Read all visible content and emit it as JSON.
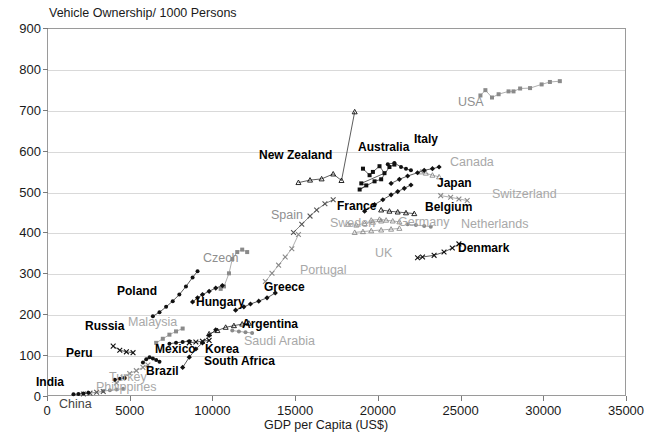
{
  "chart_data": {
    "type": "scatter",
    "title": "Vehicle Ownership/ 1000 Persons",
    "xlabel": "GDP per Capita (US$)",
    "ylabel": "Vehicle Ownership/ 1000 Persons",
    "xlim": [
      0,
      35000
    ],
    "ylim": [
      0,
      900
    ],
    "xticks": [
      0,
      5000,
      10000,
      15000,
      20000,
      25000,
      30000,
      35000
    ],
    "yticks": [
      0,
      100,
      200,
      300,
      400,
      500,
      600,
      700,
      800,
      900
    ],
    "grid": "horizontal",
    "legend": "inline-labels",
    "series": [
      {
        "name": "USA",
        "label_style": "gray",
        "marker": "square",
        "points": [
          [
            26200,
            735
          ],
          [
            26500,
            748
          ],
          [
            26900,
            730
          ],
          [
            27300,
            738
          ],
          [
            27900,
            745
          ],
          [
            28200,
            745
          ],
          [
            28600,
            752
          ],
          [
            29200,
            753
          ],
          [
            29900,
            762
          ],
          [
            30400,
            768
          ],
          [
            31000,
            770
          ]
        ]
      },
      {
        "name": "New Zealand",
        "label_style": "dark",
        "marker": "triangle",
        "points": [
          [
            15200,
            522
          ],
          [
            15900,
            528
          ],
          [
            16600,
            531
          ],
          [
            17300,
            543
          ],
          [
            17800,
            527
          ],
          [
            18600,
            695
          ]
        ]
      },
      {
        "name": "Australia",
        "label_style": "dark",
        "marker": "square",
        "points": [
          [
            19100,
            556
          ],
          [
            19500,
            540
          ],
          [
            19700,
            548
          ],
          [
            20100,
            562
          ],
          [
            20400,
            545
          ],
          [
            19000,
            520
          ],
          [
            19300,
            515
          ],
          [
            18900,
            505
          ],
          [
            19800,
            525
          ],
          [
            20200,
            530
          ],
          [
            20700,
            560
          ],
          [
            21000,
            566
          ]
        ]
      },
      {
        "name": "Italy",
        "label_style": "dark",
        "marker": "circle",
        "points": [
          [
            20600,
            567
          ],
          [
            21000,
            570
          ],
          [
            21400,
            560
          ],
          [
            21700,
            556
          ],
          [
            22000,
            552
          ]
        ]
      },
      {
        "name": "Canada",
        "label_style": "gray",
        "marker": "triangle",
        "points": [
          [
            22600,
            548
          ],
          [
            22900,
            545
          ],
          [
            23300,
            540
          ],
          [
            23700,
            536
          ]
        ]
      },
      {
        "name": "Japan",
        "label_style": "dark",
        "marker": "diamond",
        "points": [
          [
            20800,
            520
          ],
          [
            21300,
            530
          ],
          [
            21800,
            538
          ],
          [
            22400,
            546
          ],
          [
            22800,
            552
          ],
          [
            23300,
            556
          ],
          [
            23700,
            560
          ]
        ]
      },
      {
        "name": "Switzerland",
        "label_style": "gray",
        "marker": "x",
        "points": [
          [
            23800,
            490
          ],
          [
            24400,
            486
          ],
          [
            24900,
            482
          ],
          [
            25400,
            478
          ]
        ]
      },
      {
        "name": "France",
        "label_style": "dark",
        "marker": "diamond",
        "points": [
          [
            19200,
            452
          ],
          [
            19800,
            468
          ],
          [
            20300,
            480
          ],
          [
            20800,
            492
          ],
          [
            21200,
            500
          ],
          [
            21600,
            508
          ],
          [
            22000,
            516
          ]
        ]
      },
      {
        "name": "Belgium",
        "label_style": "dark",
        "marker": "triangle",
        "points": [
          [
            20200,
            455
          ],
          [
            20700,
            452
          ],
          [
            21200,
            450
          ],
          [
            21700,
            448
          ],
          [
            22200,
            446
          ]
        ]
      },
      {
        "name": "Germany",
        "label_style": "gray",
        "marker": "triangle",
        "points": [
          [
            19600,
            430
          ],
          [
            20100,
            432
          ],
          [
            20500,
            430
          ],
          [
            20900,
            428
          ],
          [
            21300,
            426
          ]
        ]
      },
      {
        "name": "Netherlands",
        "label_style": "gray",
        "marker": "circle",
        "points": [
          [
            21800,
            420
          ],
          [
            22300,
            418
          ],
          [
            22800,
            416
          ],
          [
            23200,
            414
          ]
        ]
      },
      {
        "name": "Sweden",
        "label_style": "gray",
        "marker": "triangle",
        "points": [
          [
            18200,
            420
          ],
          [
            18700,
            418
          ],
          [
            19200,
            422
          ],
          [
            19700,
            425
          ],
          [
            20200,
            428
          ]
        ]
      },
      {
        "name": "UK",
        "label_style": "gray",
        "marker": "triangle",
        "points": [
          [
            18600,
            400
          ],
          [
            19100,
            402
          ],
          [
            19600,
            404
          ],
          [
            20200,
            406
          ],
          [
            20800,
            408
          ],
          [
            21300,
            410
          ]
        ]
      },
      {
        "name": "Denmark",
        "label_style": "dark",
        "marker": "x",
        "points": [
          [
            22400,
            338
          ],
          [
            22700,
            340
          ],
          [
            23400,
            344
          ],
          [
            24000,
            352
          ],
          [
            24500,
            362
          ],
          [
            24900,
            372
          ]
        ]
      },
      {
        "name": "Spain",
        "label_style": "graydark",
        "marker": "x",
        "points": [
          [
            14900,
            400
          ],
          [
            15400,
            420
          ],
          [
            15900,
            440
          ],
          [
            16300,
            455
          ],
          [
            16800,
            470
          ],
          [
            17300,
            480
          ]
        ]
      },
      {
        "name": "Portugal",
        "label_style": "gray",
        "marker": "x",
        "points": [
          [
            13200,
            280
          ],
          [
            13600,
            300
          ],
          [
            14000,
            320
          ],
          [
            14400,
            340
          ],
          [
            14800,
            360
          ],
          [
            15200,
            395
          ]
        ]
      },
      {
        "name": "Czech",
        "label_style": "gray",
        "marker": "square",
        "points": [
          [
            10500,
            262
          ],
          [
            10700,
            268
          ],
          [
            11000,
            300
          ],
          [
            11200,
            335
          ],
          [
            11500,
            352
          ],
          [
            11800,
            358
          ],
          [
            12100,
            352
          ]
        ]
      },
      {
        "name": "Greece",
        "label_style": "dark",
        "marker": "diamond",
        "points": [
          [
            11400,
            210
          ],
          [
            11900,
            218
          ],
          [
            12300,
            225
          ],
          [
            12800,
            232
          ],
          [
            13300,
            240
          ],
          [
            13800,
            252
          ]
        ]
      },
      {
        "name": "Hungary",
        "label_style": "dark",
        "marker": "diamond",
        "points": [
          [
            8800,
            230
          ],
          [
            9100,
            240
          ],
          [
            9400,
            248
          ],
          [
            9800,
            256
          ],
          [
            10200,
            264
          ],
          [
            10600,
            270
          ]
        ]
      },
      {
        "name": "Poland",
        "label_style": "dark",
        "marker": "circle",
        "points": [
          [
            6400,
            195
          ],
          [
            6800,
            205
          ],
          [
            7200,
            218
          ],
          [
            7600,
            232
          ],
          [
            8000,
            248
          ],
          [
            8400,
            268
          ],
          [
            8800,
            290
          ],
          [
            9100,
            305
          ]
        ]
      },
      {
        "name": "Argentina",
        "label_style": "dark",
        "marker": "triangle",
        "points": [
          [
            9800,
            152
          ],
          [
            10300,
            160
          ],
          [
            10800,
            168
          ],
          [
            11300,
            172
          ],
          [
            11800,
            176
          ],
          [
            12200,
            178
          ]
        ]
      },
      {
        "name": "Saudi Arabia",
        "label_style": "gray",
        "marker": "circle",
        "points": [
          [
            11200,
            160
          ],
          [
            11600,
            158
          ],
          [
            12000,
            156
          ],
          [
            12400,
            154
          ]
        ]
      },
      {
        "name": "Korea",
        "label_style": "dark",
        "marker": "diamond",
        "points": [
          [
            8200,
            70
          ],
          [
            8600,
            95
          ],
          [
            9000,
            115
          ],
          [
            9400,
            130
          ],
          [
            9800,
            148
          ],
          [
            10200,
            162
          ]
        ]
      },
      {
        "name": "South Africa",
        "label_style": "dark",
        "marker": "x",
        "points": [
          [
            8600,
            130
          ],
          [
            9000,
            132
          ],
          [
            9400,
            134
          ],
          [
            9800,
            136
          ]
        ]
      },
      {
        "name": "Mexico",
        "label_style": "dark",
        "marker": "circle",
        "points": [
          [
            7400,
            128
          ],
          [
            7800,
            130
          ],
          [
            8200,
            132
          ],
          [
            8600,
            134
          ]
        ]
      },
      {
        "name": "Malaysia",
        "label_style": "gray",
        "marker": "square",
        "points": [
          [
            6600,
            130
          ],
          [
            7000,
            140
          ],
          [
            7400,
            150
          ],
          [
            7800,
            158
          ],
          [
            8200,
            165
          ]
        ]
      },
      {
        "name": "Brazil",
        "label_style": "dark",
        "marker": "circle",
        "points": [
          [
            5800,
            82
          ],
          [
            6000,
            90
          ],
          [
            6200,
            95
          ],
          [
            6400,
            92
          ],
          [
            6600,
            88
          ],
          [
            6800,
            84
          ]
        ]
      },
      {
        "name": "Turkey",
        "label_style": "gray",
        "marker": "x",
        "points": [
          [
            4200,
            32
          ],
          [
            4600,
            45
          ],
          [
            5000,
            55
          ],
          [
            5400,
            62
          ],
          [
            5800,
            70
          ],
          [
            6100,
            76
          ]
        ]
      },
      {
        "name": "Russia",
        "label_style": "dark",
        "marker": "x",
        "points": [
          [
            4000,
            122
          ],
          [
            4400,
            112
          ],
          [
            4800,
            108
          ],
          [
            5200,
            106
          ]
        ]
      },
      {
        "name": "Peru",
        "label_style": "dark",
        "marker": "circle",
        "points": [
          [
            4100,
            40
          ],
          [
            4400,
            42
          ],
          [
            4700,
            44
          ]
        ]
      },
      {
        "name": "Philippines",
        "label_style": "gray",
        "marker": "circle",
        "points": [
          [
            3400,
            12
          ],
          [
            3800,
            14
          ],
          [
            4200,
            16
          ],
          [
            4600,
            18
          ]
        ]
      },
      {
        "name": "China",
        "label_style": "plain",
        "marker": "x",
        "points": [
          [
            2200,
            5
          ],
          [
            2600,
            7
          ],
          [
            3000,
            9
          ],
          [
            3400,
            11
          ]
        ]
      },
      {
        "name": "India",
        "label_style": "dark",
        "marker": "circle",
        "points": [
          [
            1600,
            4
          ],
          [
            1900,
            5
          ],
          [
            2200,
            6
          ],
          [
            2500,
            8
          ]
        ]
      }
    ]
  },
  "axes": {
    "y_tick_labels": [
      "900",
      "800",
      "700",
      "600",
      "500",
      "400",
      "300",
      "200",
      "100",
      "0"
    ],
    "x_tick_labels": [
      "0",
      "5000",
      "10000",
      "15000",
      "20000",
      "25000",
      "30000",
      "35000"
    ]
  },
  "titles": {
    "chart": "Vehicle Ownership/ 1000 Persons",
    "x_axis": "GDP per Capita (US$)"
  },
  "annotations": [
    {
      "text": "USA",
      "x": 458,
      "y": 96,
      "style": "graydark"
    },
    {
      "text": "New Zealand",
      "x": 259,
      "y": 149,
      "style": "dark"
    },
    {
      "text": "Australia",
      "x": 358,
      "y": 141,
      "style": "dark"
    },
    {
      "text": "Italy",
      "x": 414,
      "y": 133,
      "style": "dark"
    },
    {
      "text": "Canada",
      "x": 450,
      "y": 156,
      "style": "gray"
    },
    {
      "text": "Japan",
      "x": 437,
      "y": 177,
      "style": "dark"
    },
    {
      "text": "Switzerland",
      "x": 492,
      "y": 188,
      "style": "gray"
    },
    {
      "text": "France",
      "x": 337,
      "y": 200,
      "style": "dark"
    },
    {
      "text": "Belgium",
      "x": 425,
      "y": 201,
      "style": "dark"
    },
    {
      "text": "Germany",
      "x": 398,
      "y": 216,
      "style": "gray"
    },
    {
      "text": "Netherlands",
      "x": 461,
      "y": 218,
      "style": "gray"
    },
    {
      "text": "Sweden",
      "x": 330,
      "y": 217,
      "style": "gray"
    },
    {
      "text": "UK",
      "x": 375,
      "y": 247,
      "style": "gray"
    },
    {
      "text": "Denmark",
      "x": 458,
      "y": 242,
      "style": "dark"
    },
    {
      "text": "Spain",
      "x": 271,
      "y": 209,
      "style": "graydark"
    },
    {
      "text": "Portugal",
      "x": 300,
      "y": 264,
      "style": "gray"
    },
    {
      "text": "Czech",
      "x": 203,
      "y": 252,
      "style": "graydark"
    },
    {
      "text": "Greece",
      "x": 264,
      "y": 281,
      "style": "dark"
    },
    {
      "text": "Hungary",
      "x": 196,
      "y": 296,
      "style": "dark"
    },
    {
      "text": "Poland",
      "x": 117,
      "y": 285,
      "style": "dark"
    },
    {
      "text": "Argentina",
      "x": 242,
      "y": 318,
      "style": "dark"
    },
    {
      "text": "Saudi Arabia",
      "x": 244,
      "y": 335,
      "style": "gray"
    },
    {
      "text": "Korea",
      "x": 205,
      "y": 343,
      "style": "dark"
    },
    {
      "text": "South Africa",
      "x": 204,
      "y": 355,
      "style": "dark"
    },
    {
      "text": "Mexico",
      "x": 155,
      "y": 343,
      "style": "dark"
    },
    {
      "text": "Malaysia",
      "x": 128,
      "y": 316,
      "style": "gray"
    },
    {
      "text": "Brazil",
      "x": 146,
      "y": 365,
      "style": "dark"
    },
    {
      "text": "Turkey",
      "x": 109,
      "y": 371,
      "style": "gray"
    },
    {
      "text": "Russia",
      "x": 85,
      "y": 320,
      "style": "dark"
    },
    {
      "text": "Peru",
      "x": 66,
      "y": 347,
      "style": "dark"
    },
    {
      "text": "Philippines",
      "x": 96,
      "y": 381,
      "style": "gray"
    },
    {
      "text": "China",
      "x": 59,
      "y": 398,
      "style": "plain"
    },
    {
      "text": "India",
      "x": 36,
      "y": 376,
      "style": "dark"
    }
  ]
}
